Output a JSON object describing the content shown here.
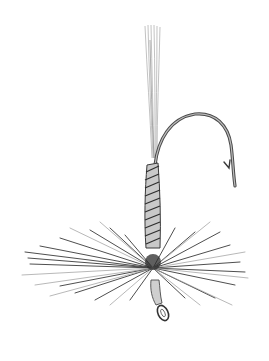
{
  "image": {
    "subject": "Pencil illustration of a dry fishing fly",
    "background": "#ffffff",
    "stroke_color": "#3a3a3a",
    "light_stroke_color": "#9a9a9a"
  },
  "parts": {
    "tail": "Tail fibers",
    "hook": "Hook bend with barb",
    "body": "Thread-wrapped body",
    "hackle": "Radiating hackle fibers",
    "eye": "Hook eye"
  }
}
